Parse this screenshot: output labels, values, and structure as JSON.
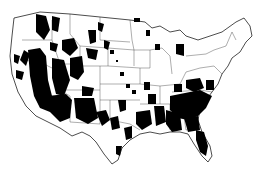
{
  "map": {
    "type": "choropleth",
    "region": "contiguous-united-states",
    "unit": "county",
    "colors": {
      "background": "#ffffff",
      "highlighted": "#000000",
      "not_highlighted": "#ffffff",
      "borders": "#333333"
    },
    "highlighted_areas": [
      {
        "name": "interior-west-great-basin",
        "density": "high"
      },
      {
        "name": "northern-rockies",
        "density": "high"
      },
      {
        "name": "arizona-new-mexico",
        "density": "high"
      },
      {
        "name": "wyoming-colorado",
        "density": "medium"
      },
      {
        "name": "northern-plains",
        "density": "low"
      },
      {
        "name": "texas",
        "density": "medium"
      },
      {
        "name": "lower-mississippi-valley",
        "density": "medium"
      },
      {
        "name": "southeast-atlantic-georgia-carolinas",
        "density": "high"
      },
      {
        "name": "florida",
        "density": "high"
      },
      {
        "name": "upper-midwest-michigan-wisconsin",
        "density": "low"
      },
      {
        "name": "appalachia-virginia",
        "density": "medium"
      }
    ],
    "legend": null,
    "title": null
  }
}
